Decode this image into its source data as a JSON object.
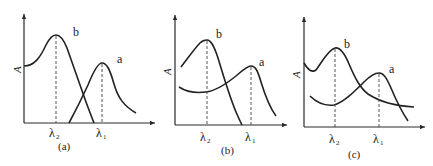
{
  "figure": {
    "panels": [
      {
        "id": "a",
        "caption": "(a)",
        "y_axis_label": "A",
        "x_ticks": [
          {
            "symbol": "λ",
            "subscript": "2"
          },
          {
            "symbol": "λ",
            "subscript": "1"
          }
        ],
        "curves": [
          {
            "label": "b",
            "peak_at": "λ2"
          },
          {
            "label": "a",
            "peak_at": "λ1"
          }
        ]
      },
      {
        "id": "b",
        "caption": "(b)",
        "y_axis_label": "A",
        "x_ticks": [
          {
            "symbol": "λ",
            "subscript": "2"
          },
          {
            "symbol": "λ",
            "subscript": "1"
          }
        ],
        "curves": [
          {
            "label": "b",
            "peak_at": "λ2"
          },
          {
            "label": "a",
            "peak_at": "λ1"
          }
        ]
      },
      {
        "id": "c",
        "caption": "(c)",
        "y_axis_label": "A",
        "x_ticks": [
          {
            "symbol": "λ",
            "subscript": "2"
          },
          {
            "symbol": "λ",
            "subscript": "1"
          }
        ],
        "curves": [
          {
            "label": "b",
            "peak_at": "λ2"
          },
          {
            "label": "a",
            "peak_at": "λ1"
          }
        ]
      }
    ]
  }
}
